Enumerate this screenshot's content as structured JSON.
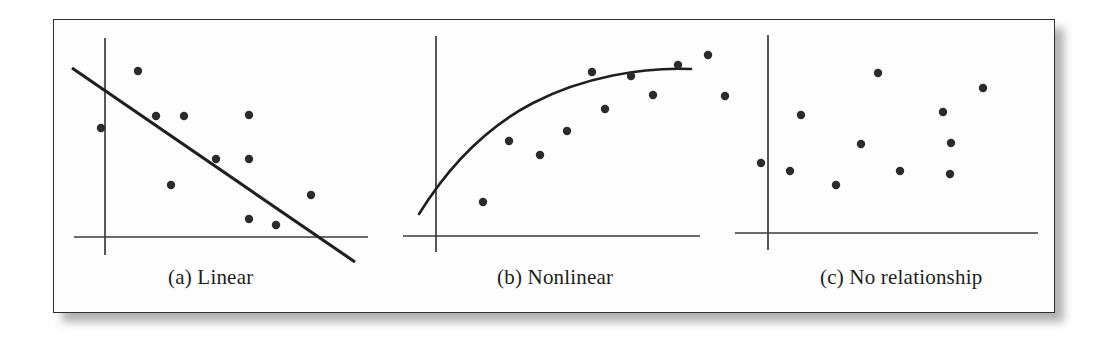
{
  "figure": {
    "background_color": "#ffffff",
    "frame_color": "#2e2e2e",
    "shadow_color": "#9a9a9a",
    "axis_color": "#3a3a3a",
    "dot_color": "#2b2b2b",
    "trend_color": "#1f1f1f",
    "dot_radius": 4.2
  },
  "panels": [
    {
      "id": "linear",
      "caption": "(a) Linear",
      "axes": {
        "y_axis": {
          "x": 52,
          "y_top": 19,
          "y_bottom": 236
        },
        "x_axis": {
          "y": 218,
          "x_left": 21,
          "x_right": 315
        }
      },
      "trend": {
        "type": "line",
        "from": {
          "x": 19,
          "y": 49
        },
        "to": {
          "x": 302,
          "y": 243
        }
      },
      "points": [
        {
          "x": 85,
          "y": 52
        },
        {
          "x": 103,
          "y": 97
        },
        {
          "x": 48,
          "y": 109
        },
        {
          "x": 131,
          "y": 97
        },
        {
          "x": 196,
          "y": 96
        },
        {
          "x": 163,
          "y": 140
        },
        {
          "x": 196,
          "y": 140
        },
        {
          "x": 118,
          "y": 166
        },
        {
          "x": 258,
          "y": 176
        },
        {
          "x": 196,
          "y": 200
        },
        {
          "x": 223,
          "y": 206
        }
      ]
    },
    {
      "id": "nonlinear",
      "caption": "(b) Nonlinear",
      "axes": {
        "y_axis": {
          "x": 383,
          "y_top": 17,
          "y_bottom": 233
        },
        "x_axis": {
          "y": 217,
          "x_left": 350,
          "x_right": 647
        }
      },
      "trend": {
        "type": "curve",
        "path": "M 366 195 C 392 153, 430 110, 480 84 C 530 58, 590 48, 638 50"
      },
      "points": [
        {
          "x": 430,
          "y": 183
        },
        {
          "x": 456,
          "y": 122
        },
        {
          "x": 487,
          "y": 136
        },
        {
          "x": 514,
          "y": 112
        },
        {
          "x": 552,
          "y": 90
        },
        {
          "x": 539,
          "y": 53
        },
        {
          "x": 578,
          "y": 57
        },
        {
          "x": 600,
          "y": 76
        },
        {
          "x": 625,
          "y": 46
        },
        {
          "x": 655,
          "y": 36
        },
        {
          "x": 672,
          "y": 77
        }
      ]
    },
    {
      "id": "no-relationship",
      "caption": "(c) No relationship",
      "axes": {
        "y_axis": {
          "x": 715,
          "y_top": 16,
          "y_bottom": 231
        },
        "x_axis": {
          "y": 214,
          "x_left": 682,
          "x_right": 985
        }
      },
      "trend": null,
      "points": [
        {
          "x": 748,
          "y": 96
        },
        {
          "x": 708,
          "y": 144
        },
        {
          "x": 825,
          "y": 54
        },
        {
          "x": 930,
          "y": 69
        },
        {
          "x": 890,
          "y": 93
        },
        {
          "x": 808,
          "y": 125
        },
        {
          "x": 898,
          "y": 124
        },
        {
          "x": 737,
          "y": 152
        },
        {
          "x": 847,
          "y": 152
        },
        {
          "x": 897,
          "y": 155
        },
        {
          "x": 783,
          "y": 166
        }
      ]
    }
  ],
  "chart_data": {
    "type": "scatter",
    "title": "",
    "subtitle": "",
    "xlabel": "",
    "ylabel": "",
    "grid": false,
    "legend": "none",
    "panels": [
      {
        "label": "(a) Linear",
        "relationship": "negative linear",
        "fit": "straight line",
        "n_points": 11,
        "x": [
          0.12,
          0.26,
          0.31,
          0.37,
          0.4,
          0.48,
          0.6,
          0.6,
          0.6,
          0.71,
          0.84
        ],
        "y": [
          0.76,
          0.5,
          0.55,
          0.55,
          0.24,
          0.36,
          0.55,
          0.36,
          0.08,
          0.06,
          0.19
        ],
        "xlim": [
          0,
          1
        ],
        "ylim": [
          0,
          1
        ]
      },
      {
        "label": "(b) Nonlinear",
        "relationship": "nonlinear concave (increasing then leveling off)",
        "fit": "quadratic curve",
        "n_points": 11,
        "x": [
          0.16,
          0.25,
          0.35,
          0.44,
          0.53,
          0.57,
          0.66,
          0.73,
          0.82,
          0.92,
          0.97
        ],
        "y": [
          0.16,
          0.44,
          0.37,
          0.48,
          0.58,
          0.75,
          0.74,
          0.65,
          0.79,
          0.83,
          0.64
        ],
        "xlim": [
          0,
          1
        ],
        "ylim": [
          0,
          1
        ]
      },
      {
        "label": "(c) No relationship",
        "relationship": "none",
        "fit": "none",
        "n_points": 11,
        "x": [
          0.08,
          0.11,
          0.24,
          0.33,
          0.36,
          0.44,
          0.56,
          0.6,
          0.61,
          0.71,
          0.73
        ],
        "y": [
          0.29,
          0.55,
          0.22,
          0.74,
          0.41,
          0.29,
          0.59,
          0.41,
          0.27,
          0.68,
          0.41
        ],
        "xlim": [
          0,
          1
        ],
        "ylim": [
          0,
          1
        ]
      }
    ]
  }
}
